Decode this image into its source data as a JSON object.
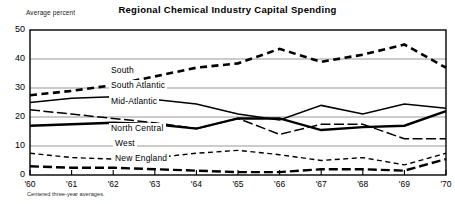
{
  "chart_data": {
    "type": "line",
    "title": "Regional Chemical Industry Capital Spending",
    "ylabel": "Average percent",
    "xlabel": "",
    "footnote": "Centered three-year averages.",
    "x": [
      "'60",
      "'61",
      "'62",
      "'63",
      "'64",
      "'65",
      "'66",
      "'67",
      "'68",
      "'69",
      "'70"
    ],
    "xtick_labels": [
      "'60",
      "'61",
      "'62",
      "'63",
      "'64",
      "'65",
      "'66",
      "'67",
      "'68",
      "'69",
      "'70"
    ],
    "ytick_labels": [
      "0",
      "10",
      "20",
      "30",
      "40",
      "50"
    ],
    "ytick_values": [
      0,
      10,
      20,
      30,
      40,
      50
    ],
    "ylim": [
      0,
      50
    ],
    "grid": true,
    "legend_position": "inline-labels",
    "series": [
      {
        "name": "South",
        "style": "dashed-heavy",
        "values": [
          27.5,
          29.0,
          31.0,
          34.0,
          37.0,
          38.5,
          43.5,
          39.0,
          41.5,
          45.0,
          37.0
        ]
      },
      {
        "name": "South Atlantic",
        "style": "solid-medium",
        "values": [
          25.0,
          26.5,
          27.0,
          26.0,
          24.5,
          21.0,
          19.0,
          24.0,
          21.0,
          24.5,
          23.0
        ]
      },
      {
        "name": "Mid-Atlantic",
        "style": "dash-dot",
        "values": [
          22.5,
          21.0,
          19.5,
          18.0,
          16.0,
          19.5,
          14.0,
          17.5,
          17.5,
          12.5,
          12.5
        ]
      },
      {
        "name": "North Central",
        "style": "solid-heavy",
        "values": [
          17.0,
          17.5,
          18.0,
          17.5,
          16.0,
          19.5,
          19.5,
          15.5,
          16.5,
          17.0,
          22.0
        ]
      },
      {
        "name": "West",
        "style": "dashed-light",
        "values": [
          7.5,
          6.0,
          5.5,
          6.0,
          7.5,
          8.5,
          7.0,
          5.0,
          6.0,
          3.5,
          7.5
        ]
      },
      {
        "name": "New England",
        "style": "long-dash-heavy",
        "values": [
          3.0,
          2.5,
          2.5,
          2.0,
          1.5,
          1.0,
          1.0,
          2.0,
          2.0,
          1.5,
          5.5
        ]
      }
    ],
    "series_label_positions": [
      {
        "name": "South",
        "x": 109,
        "y": 71
      },
      {
        "name": "South Atlantic",
        "x": 109,
        "y": 86
      },
      {
        "name": "Mid-Atlantic",
        "x": 109,
        "y": 102
      },
      {
        "name": "North Central",
        "x": 109,
        "y": 129
      },
      {
        "name": "West",
        "x": 113,
        "y": 144
      },
      {
        "name": "New England",
        "x": 113,
        "y": 159
      }
    ]
  }
}
